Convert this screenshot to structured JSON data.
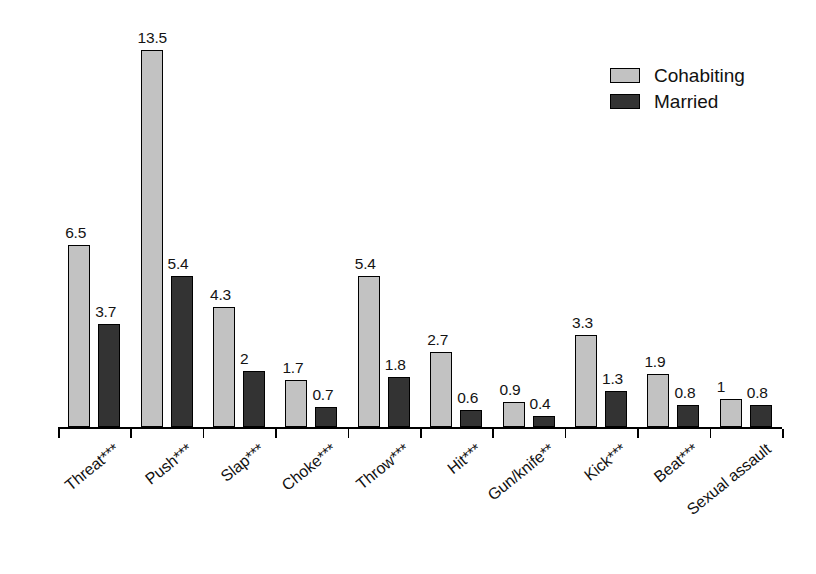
{
  "chart_data": {
    "type": "bar",
    "title": "",
    "subtitle": "",
    "xlabel": "",
    "ylabel": "",
    "ylim": [
      0,
      13.5
    ],
    "grid": false,
    "legend_position": "top-right",
    "categories": [
      "Threat***",
      "Push***",
      "Slap***",
      "Choke***",
      "Throw***",
      "Hit***",
      "Gun/knife**",
      "Kick***",
      "Beat***",
      "Sexual assault"
    ],
    "series": [
      {
        "name": "Cohabiting",
        "color": "#c2c2c2",
        "values": [
          6.5,
          13.5,
          4.3,
          1.7,
          5.4,
          2.7,
          0.9,
          3.3,
          1.9,
          1
        ],
        "value_labels": [
          "6.5",
          "13.5",
          "4.3",
          "1.7",
          "5.4",
          "2.7",
          "0.9",
          "3.3",
          "1.9",
          "1"
        ]
      },
      {
        "name": "Married",
        "color": "#333333",
        "values": [
          3.7,
          5.4,
          2,
          0.7,
          1.8,
          0.6,
          0.4,
          1.3,
          0.8,
          0.8
        ],
        "value_labels": [
          "3.7",
          "5.4",
          "2",
          "0.7",
          "1.8",
          "0.6",
          "0.4",
          "1.3",
          "0.8",
          "0.8"
        ]
      }
    ]
  },
  "legend": {
    "items": [
      {
        "label": "Cohabiting",
        "swatch": "cohabiting"
      },
      {
        "label": "Married",
        "swatch": "married"
      }
    ]
  }
}
